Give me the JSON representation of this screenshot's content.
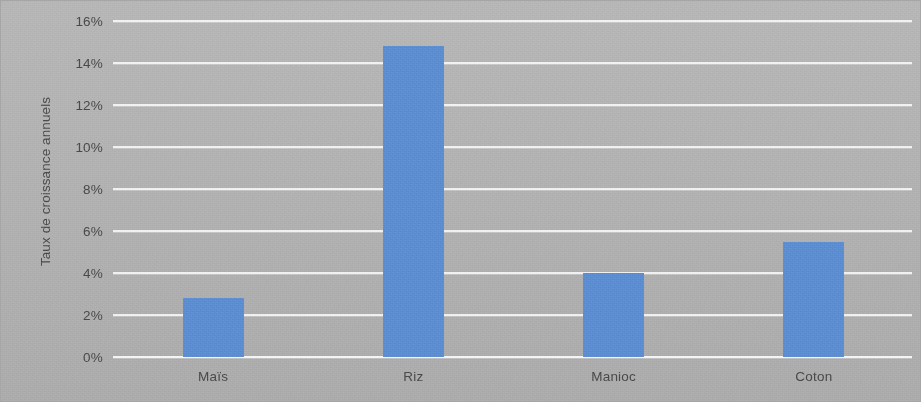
{
  "chart_data": {
    "type": "bar",
    "title": "",
    "subtitle": "",
    "xlabel": "",
    "ylabel": "Taux de croissance annuels",
    "categories": [
      "Maïs",
      "Riz",
      "Manioc",
      "Coton"
    ],
    "values": [
      2.8,
      14.8,
      4.0,
      5.5
    ],
    "series": [
      {
        "name": "Taux de croissance annuels",
        "values": [
          2.8,
          14.8,
          4.0,
          5.5
        ]
      }
    ],
    "ylim": [
      0,
      16
    ],
    "ytick_values": [
      0,
      2,
      4,
      6,
      8,
      10,
      12,
      14,
      16
    ],
    "ytick_labels": [
      "0%",
      "2%",
      "4%",
      "6%",
      "8%",
      "10%",
      "12%",
      "14%",
      "16%"
    ],
    "grid": true,
    "grid_axis": "y",
    "legend": false,
    "legend_position": "none",
    "bar_color": "#5d8ed2",
    "plot_background": "#b4b4b4",
    "gridline_color": "#ffffff",
    "text_color": "#4a4a4a",
    "annotations": []
  }
}
